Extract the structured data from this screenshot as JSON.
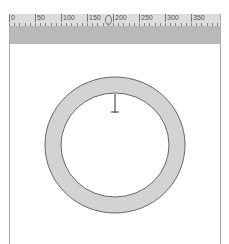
{
  "ruler": {
    "labels": [
      "0",
      "50",
      "100",
      "150",
      "200",
      "250",
      "300",
      "350"
    ],
    "handle_position": "~190"
  },
  "canvas": {
    "shape": "ring",
    "ring_fill": "#d3d3d3",
    "ring_stroke": "#666666",
    "marker": "crosshair-cursor"
  },
  "colors": {
    "ruler_bg": "#dcdcdc",
    "band_bg": "#b9b9b9",
    "frame": "#aaaaaa"
  }
}
